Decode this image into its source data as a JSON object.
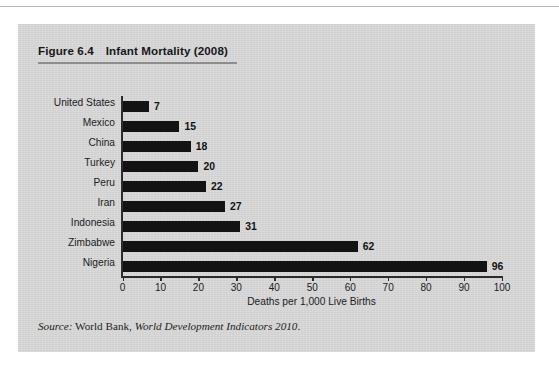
{
  "figure": {
    "number_label": "Figure 6.4",
    "title": "Infant Mortality (2008)",
    "source_prefix": "Source:",
    "source_publisher": "World Bank,",
    "source_title": "World Development Indicators 2010",
    "source_period": "."
  },
  "colors": {
    "panel": "#d9d9d9",
    "bar": "#131313",
    "axis": "#2b2b2b",
    "rule": "#8d8d8d",
    "text": "#1b1b1e"
  },
  "chart_data": {
    "type": "bar",
    "orientation": "horizontal",
    "title": "Infant Mortality (2008)",
    "xlabel": "Deaths per 1,000 Live Births",
    "ylabel": "",
    "xlim": [
      0,
      100
    ],
    "xticks": [
      0,
      10,
      20,
      30,
      40,
      50,
      60,
      70,
      80,
      90,
      100
    ],
    "xtick_labels": [
      "0",
      "10",
      "20",
      "30",
      "40",
      "50",
      "60",
      "70",
      "80",
      "90",
      "100"
    ],
    "grid": false,
    "legend": false,
    "value_labels": true,
    "categories": [
      "United States",
      "Mexico",
      "China",
      "Turkey",
      "Peru",
      "Iran",
      "Indonesia",
      "Zimbabwe",
      "Nigeria"
    ],
    "values": [
      7,
      15,
      18,
      20,
      22,
      27,
      31,
      62,
      96
    ],
    "value_label_text": [
      "7",
      "15",
      "18",
      "20",
      "22",
      "27",
      "31",
      "62",
      "96"
    ]
  }
}
